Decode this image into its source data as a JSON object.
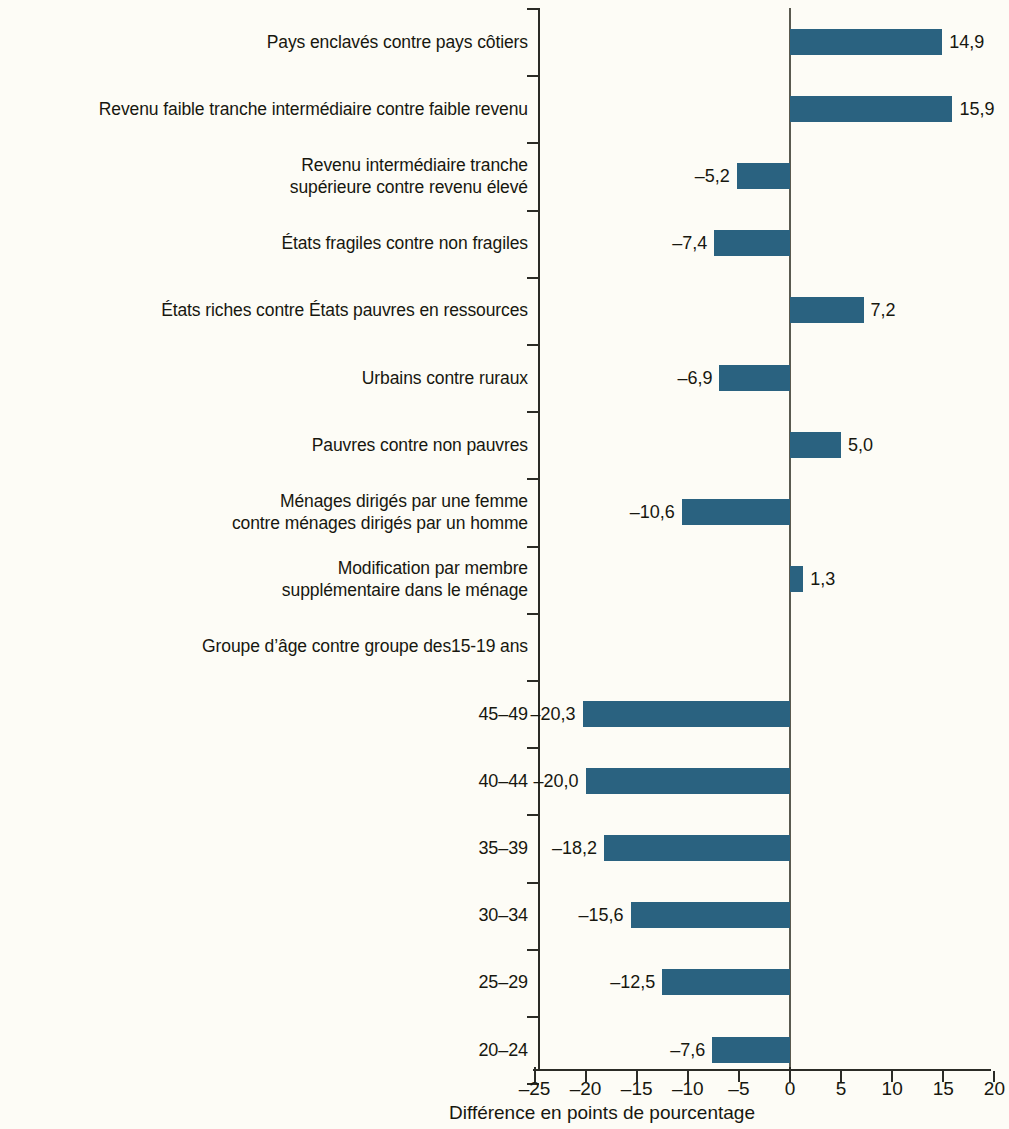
{
  "chart_data": {
    "type": "bar",
    "orientation": "horizontal",
    "title": "",
    "xlabel": "Différence en points de pourcentage",
    "ylabel": "",
    "xlim": [
      -25,
      20
    ],
    "xticks": [
      "-25",
      "-20",
      "-15",
      "-10",
      "-5",
      "0",
      "5",
      "10",
      "15",
      "20"
    ],
    "xtick_values": [
      -25,
      -20,
      -15,
      -10,
      -5,
      0,
      5,
      10,
      15,
      20
    ],
    "grid": false,
    "legend": "none",
    "bar_color": "#2a6280",
    "background_color": "#fdfcf6",
    "value_decimal_separator": ",",
    "categories": [
      "Pays enclavés contre pays côtiers",
      "Revenu faible tranche intermédiaire contre faible revenu",
      "Revenu intermédiaire tranche\nsupérieure contre revenu élevé",
      "États fragiles contre non fragiles",
      "États riches contre États pauvres en ressources",
      "Urbains contre ruraux",
      "Pauvres contre non pauvres",
      "Ménages dirigés par une femme\ncontre ménages dirigés par un homme",
      "Modification par membre\nsupplémentaire dans le ménage",
      "Groupe d’âge contre groupe des15-19 ans",
      "45–49",
      "40–44",
      "35–39",
      "30–34",
      "25–29",
      "20–24"
    ],
    "values": [
      14.9,
      15.9,
      -5.2,
      -7.4,
      7.2,
      -6.9,
      5.0,
      -10.6,
      1.3,
      null,
      -20.3,
      -20.0,
      -18.2,
      -15.6,
      -12.5,
      -7.6
    ],
    "value_labels": [
      "14,9",
      "15,9",
      "–5,2",
      "–7,4",
      "7,2",
      "–6,9",
      "5,0",
      "–10,6",
      "1,3",
      "",
      "–20,3",
      "–20,0",
      "–18,2",
      "–15,6",
      "–12,5",
      "–7,6"
    ]
  },
  "rows": [
    {
      "label": "Pays enclavés contre pays côtiers",
      "value_label": "14,9",
      "lines": 1,
      "group": false
    },
    {
      "label": "Revenu faible tranche intermédiaire contre faible revenu",
      "value_label": "15,9",
      "lines": 1,
      "group": false
    },
    {
      "label": "Revenu intermédiaire tranche\nsupérieure contre revenu élevé",
      "value_label": "–5,2",
      "lines": 2,
      "group": false
    },
    {
      "label": "États fragiles contre non fragiles",
      "value_label": "–7,4",
      "lines": 1,
      "group": false
    },
    {
      "label": "États riches contre États pauvres en ressources",
      "value_label": "7,2",
      "lines": 1,
      "group": false
    },
    {
      "label": "Urbains contre ruraux",
      "value_label": "–6,9",
      "lines": 1,
      "group": false
    },
    {
      "label": "Pauvres contre non pauvres",
      "value_label": "5,0",
      "lines": 1,
      "group": false
    },
    {
      "label": "Ménages dirigés par une femme\ncontre ménages dirigés par un homme",
      "value_label": "–10,6",
      "lines": 2,
      "group": false
    },
    {
      "label": "Modification par membre\nsupplémentaire dans le ménage",
      "value_label": "1,3",
      "lines": 2,
      "group": false
    },
    {
      "label": "Groupe d’âge contre groupe des15-19 ans",
      "value_label": "",
      "lines": 1,
      "group": true
    },
    {
      "label": "45–49",
      "value_label": "–20,3",
      "lines": 1,
      "group": false
    },
    {
      "label": "40–44",
      "value_label": "–20,0",
      "lines": 1,
      "group": false
    },
    {
      "label": "35–39",
      "value_label": "–18,2",
      "lines": 1,
      "group": false
    },
    {
      "label": "30–34",
      "value_label": "–15,6",
      "lines": 1,
      "group": false
    },
    {
      "label": "25–29",
      "value_label": "–12,5",
      "lines": 1,
      "group": false
    },
    {
      "label": "20–24",
      "value_label": "–7,6",
      "lines": 1,
      "group": false
    }
  ],
  "axis": {
    "x_title": "Différence en points de pourcentage",
    "tick_labels": [
      "–25",
      "–20",
      "–15",
      "–10",
      "–5",
      "0",
      "5",
      "10",
      "15",
      "20"
    ]
  }
}
